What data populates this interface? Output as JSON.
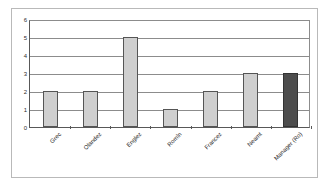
{
  "chart_data": {
    "type": "bar",
    "title": "",
    "subtitle": "",
    "xlabel": "",
    "ylabel": "",
    "ylim": [
      0,
      6
    ],
    "ytick_labels": [
      "0",
      "1",
      "2",
      "3",
      "4",
      "5",
      "6"
    ],
    "grid": true,
    "legend": "none",
    "categories": [
      "Grec",
      "Olandez",
      "Englez",
      "Romîn",
      "Francez",
      "Neamt",
      "Manager (Ro)"
    ],
    "values": [
      2,
      2,
      5,
      1,
      2,
      3,
      3
    ],
    "series": [
      {
        "name": "counts",
        "values": [
          2,
          2,
          5,
          1,
          2,
          3,
          3
        ]
      }
    ],
    "bar_styles": [
      "main",
      "main",
      "main",
      "main",
      "main",
      "main",
      "highlight"
    ],
    "annotations": []
  },
  "colors": {
    "bar_main_fill": "#cfcfcf",
    "bar_main_border": "#555555",
    "bar_highlight_fill": "#4d4d4d",
    "bar_highlight_border": "#333333",
    "gridline": "#8c8c8c",
    "axis": "#585858",
    "frame": "#b9b9b9",
    "background": "#ffffff",
    "text": "#2b2b2b"
  }
}
